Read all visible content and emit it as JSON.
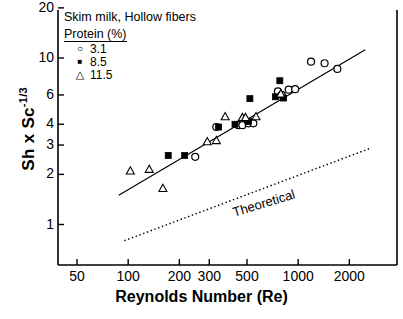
{
  "chart_data": {
    "type": "scatter",
    "title": "",
    "xlabel": "Reynolds Number (Re)",
    "ylabel": "Sh x Sc-1/3",
    "ylabel_base": "Sh x Sc",
    "ylabel_exp": "-1/3",
    "xscale": "log",
    "yscale": "log",
    "xlim": [
      50,
      2600
    ],
    "ylim": [
      0.72,
      20
    ],
    "xticks": [
      50,
      100,
      200,
      300,
      500,
      1000,
      2000
    ],
    "xticklabels": [
      "50",
      "100",
      "200",
      "300",
      "500",
      "1000",
      "2000"
    ],
    "yticks": [
      1,
      2,
      3,
      4,
      6,
      10,
      20
    ],
    "yticklabels": [
      "1",
      "2",
      "3",
      "4",
      "6",
      "10",
      "20"
    ],
    "grid": false,
    "legend_position": "top-left",
    "series": [
      {
        "name": "3.1",
        "marker": "open-circle",
        "points": [
          [
            248,
            2.55
          ],
          [
            330,
            3.85
          ],
          [
            445,
            3.95
          ],
          [
            470,
            3.95
          ],
          [
            510,
            4.05
          ],
          [
            545,
            4.05
          ],
          [
            760,
            6.3
          ],
          [
            800,
            6.0
          ],
          [
            880,
            6.45
          ],
          [
            960,
            6.5
          ],
          [
            1190,
            9.5
          ],
          [
            1430,
            9.3
          ],
          [
            1700,
            8.6
          ]
        ]
      },
      {
        "name": "8.5",
        "marker": "filled-square",
        "points": [
          [
            172,
            2.6
          ],
          [
            215,
            2.6
          ],
          [
            340,
            3.85
          ],
          [
            425,
            4.0
          ],
          [
            510,
            4.15
          ],
          [
            520,
            5.7
          ],
          [
            735,
            5.85
          ],
          [
            780,
            7.3
          ],
          [
            820,
            5.75
          ]
        ]
      },
      {
        "name": "11.5",
        "marker": "open-triangle",
        "points": [
          [
            103,
            2.1
          ],
          [
            133,
            2.15
          ],
          [
            160,
            1.65
          ],
          [
            292,
            3.15
          ],
          [
            330,
            3.2
          ],
          [
            372,
            4.45
          ],
          [
            470,
            4.4
          ],
          [
            490,
            4.4
          ],
          [
            565,
            4.45
          ],
          [
            790,
            6.1
          ]
        ]
      }
    ],
    "lines": [
      {
        "name": "regression-line",
        "style": "solid",
        "points": [
          [
            88,
            1.5
          ],
          [
            2480,
            11.2
          ]
        ]
      },
      {
        "name": "theoretical-line",
        "style": "dotted",
        "label": "Theoretical",
        "points": [
          [
            95,
            0.8
          ],
          [
            2610,
            2.85
          ]
        ]
      }
    ],
    "annotations": [
      {
        "name": "theoretical-label",
        "text": "Theoretical",
        "x": 900,
        "y": 1.45
      }
    ]
  },
  "legend": {
    "title_line1": "Skim milk,  Hollow fibers",
    "title_line2": "Protein (%)",
    "entries": [
      {
        "symbol": "○",
        "label": "3.1"
      },
      {
        "symbol": "■",
        "label": "8.5"
      },
      {
        "symbol": "△",
        "label": "11.5"
      }
    ]
  },
  "axes": {
    "x_title": "Reynolds Number (Re)",
    "y_title_base": "Sh x Sc",
    "y_title_exp": "-1/3"
  },
  "colors": {
    "foreground": "#000000",
    "background": "#ffffff"
  }
}
